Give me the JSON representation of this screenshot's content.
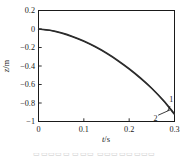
{
  "figure": {
    "background_color": "#ffffff",
    "axis_color": "#1a1a1a",
    "curve_color": "#2b2b2b",
    "caption_fragment": "▭▭▭▭▭ ▭▭▭ ▭▭▭▭▭▭▭▭"
  },
  "chart_data": {
    "type": "line",
    "title": "",
    "xlabel": "t/s",
    "ylabel": "z/m",
    "xlabel_symbol": "t",
    "xlabel_unit": "/s",
    "ylabel_symbol": "z",
    "ylabel_unit": "/m",
    "xlim": [
      0,
      0.3
    ],
    "ylim": [
      -1,
      0.2
    ],
    "xticks": [
      0,
      0.1,
      0.2,
      0.3
    ],
    "xticklabels": [
      "0",
      "0.1",
      "0.2",
      "0.3"
    ],
    "yticks": [
      0.2,
      0,
      -0.2,
      -0.4,
      -0.6,
      -0.8,
      -1
    ],
    "yticklabels": [
      "0.2",
      "0",
      "-0.2",
      "-0.4",
      "-0.6",
      "-0.8",
      "-1"
    ],
    "grid": false,
    "legend": "none",
    "tick_direction": "in",
    "box_frame": true,
    "series": [
      {
        "name": "1",
        "annotation_label": "1",
        "x": [
          0,
          0.025,
          0.05,
          0.075,
          0.1,
          0.125,
          0.15,
          0.175,
          0.2,
          0.225,
          0.25,
          0.275,
          0.3
        ],
        "y": [
          0,
          -0.016,
          -0.045,
          -0.085,
          -0.135,
          -0.195,
          -0.265,
          -0.345,
          -0.435,
          -0.535,
          -0.645,
          -0.775,
          -0.925
        ]
      },
      {
        "name": "2",
        "annotation_label": "2",
        "x": [
          0,
          0.025,
          0.05,
          0.075,
          0.1,
          0.125,
          0.15,
          0.175,
          0.2,
          0.225,
          0.25,
          0.275,
          0.3
        ],
        "y": [
          0,
          -0.013,
          -0.04,
          -0.079,
          -0.128,
          -0.188,
          -0.257,
          -0.337,
          -0.427,
          -0.527,
          -0.64,
          -0.768,
          -0.915
        ]
      }
    ],
    "annotations": [
      {
        "label": "1",
        "x": 0.293,
        "y": -0.805,
        "points_to_x": 0.285,
        "points_to_y": -0.885
      },
      {
        "label": "2",
        "x": 0.258,
        "y": -0.945,
        "points_to_x": 0.29,
        "points_to_y": -0.875
      }
    ]
  }
}
